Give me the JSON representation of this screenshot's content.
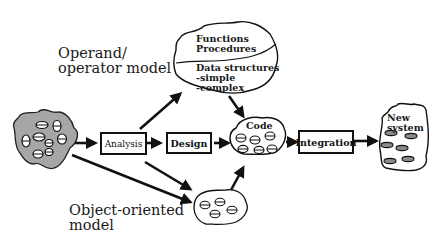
{
  "diagram": {
    "labels": {
      "operand_model": [
        "Operand/",
        "operator model"
      ],
      "object_model": [
        "Object-oriented",
        "model"
      ]
    },
    "cloud_top": {
      "upper": [
        "Functions",
        "Procedures"
      ],
      "lower": [
        "Data  structures",
        "-simple",
        "-complex"
      ]
    },
    "boxes": {
      "analysis": "Analysis",
      "design": "Design",
      "integration": "Integration"
    },
    "code_blob": "Code",
    "new_system": [
      "New",
      "system"
    ],
    "colors": {
      "ink": "#111111",
      "gray_fill": "#a6a6a6",
      "background": "#ffffff"
    }
  }
}
